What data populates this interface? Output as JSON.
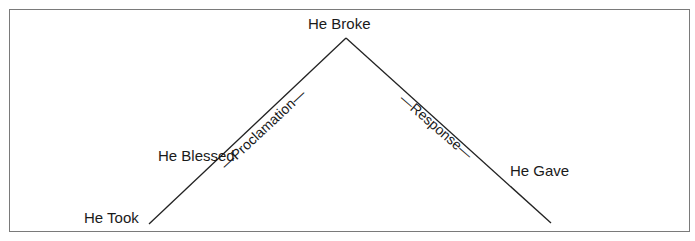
{
  "diagram": {
    "type": "inverted-v-flow",
    "colors": {
      "line": "#222222",
      "frame": "#7a7a7a",
      "text": "#1a1a1a"
    },
    "nodes": {
      "apex": "He Broke",
      "left_upper": "He Blessed",
      "left_bottom": "He Took",
      "right_lower": "He Gave"
    },
    "edges": {
      "left": "—Proclamation—",
      "right": "—Response—"
    }
  }
}
